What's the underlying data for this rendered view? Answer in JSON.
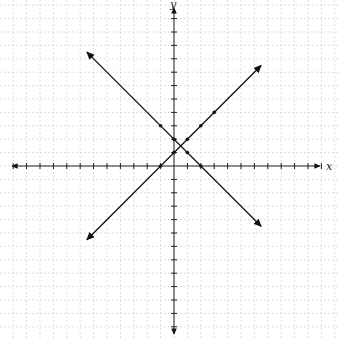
{
  "chart_data": {
    "type": "line",
    "title": "",
    "xlabel": "x",
    "ylabel": "y",
    "xlim": [
      -12,
      11
    ],
    "ylim": [
      -12,
      12
    ],
    "grid": true,
    "series": [
      {
        "name": "y = -x + 2",
        "slope": -1,
        "intercept": 2,
        "points": [
          [
            -1,
            3
          ],
          [
            0,
            2
          ],
          [
            1,
            1
          ],
          [
            2,
            0
          ]
        ],
        "range": [
          -6.5,
          6.5
        ]
      },
      {
        "name": "y = x + 1",
        "slope": 1,
        "intercept": 1,
        "points": [
          [
            -1,
            0
          ],
          [
            0,
            1
          ],
          [
            1,
            2
          ],
          [
            2,
            3
          ],
          [
            3,
            4
          ]
        ],
        "range": [
          -6.5,
          6.5
        ]
      }
    ]
  },
  "axes": {
    "x_label": "x",
    "y_label": "y"
  },
  "colors": {
    "line": "#111111",
    "grid": "#c8c8c8",
    "axis": "#222222"
  }
}
